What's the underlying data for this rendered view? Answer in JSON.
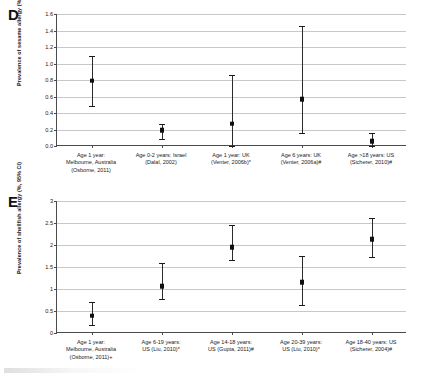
{
  "figure": {
    "panels": [
      {
        "letter": "D",
        "ylabel": "Prevalence of sesame allergy (%, 95% CI)"
      },
      {
        "letter": "E",
        "ylabel": "Prevalence of shellfish allergy (%, 95% CI)"
      }
    ]
  },
  "chart_data": [
    {
      "type": "scatter",
      "panel": "D",
      "title": "",
      "xlabel": "",
      "ylabel": "Prevalence of sesame allergy (%, 95% CI)",
      "ylim": [
        0.0,
        1.6
      ],
      "yticks": [
        "0.0",
        "0.2",
        "0.4",
        "0.6",
        "0.8",
        "1.0",
        "1.2",
        "1.4",
        "1.6"
      ],
      "ytick_values": [
        0.0,
        0.2,
        0.4,
        0.6,
        0.8,
        1.0,
        1.2,
        1.4,
        1.6
      ],
      "grid": true,
      "legend": "none",
      "categories": [
        "Age 1 year: Melbourne, Australia (Osborne, 2011)",
        "Age 0-2 years: Israel (Dalal, 2002)",
        "Age 1 year: UK (Venter, 2006b)*",
        "Age 6 years: UK (Venter, 2006a)#",
        "Age >18 years: US (Sicherer, 2010)#"
      ],
      "category_lines": [
        [
          "Age 1 year:",
          "Melbourne, Australia",
          "(Osborne, 2011)"
        ],
        [
          "Age 0-2 years: Israel",
          "(Dalal, 2002)"
        ],
        [
          "Age 1 year: UK",
          "(Venter, 2006b)*"
        ],
        [
          "Age 6 years: UK",
          "(Venter, 2006a)#"
        ],
        [
          "Age >18 years: US",
          "(Sicherer, 2010)#"
        ]
      ],
      "values": [
        0.79,
        0.19,
        0.27,
        0.57,
        0.06
      ],
      "ci_low": [
        0.49,
        0.08,
        0.0,
        0.16,
        -0.03
      ],
      "ci_high": [
        1.09,
        0.27,
        0.86,
        1.46,
        0.16
      ]
    },
    {
      "type": "scatter",
      "panel": "E",
      "title": "",
      "xlabel": "",
      "ylabel": "Prevalence of shellfish allergy (%, 95% CI)",
      "ylim": [
        0,
        3
      ],
      "yticks": [
        "0",
        "0.5",
        "1",
        "1.5",
        "2",
        "2.5",
        "3"
      ],
      "ytick_values": [
        0,
        0.5,
        1,
        1.5,
        2,
        2.5,
        3
      ],
      "grid": true,
      "legend": "none",
      "categories": [
        "Age 1 year: Melbourne, Australia (Osborne, 2011)+",
        "Age 6-19 years: US (Liu, 2010)*",
        "Age 14-18 years: US (Gupta, 2011)#",
        "Age 20-39 years: US (Liu, 2010)*",
        "Age 18-40 years: US (Sicherer, 2004)#"
      ],
      "category_lines": [
        [
          "Age 1 year:",
          "Melbourne, Australia",
          "(Osborne, 2011)+"
        ],
        [
          "Age 6-19 years:",
          "US (Liu, 2010)*"
        ],
        [
          "Age 14-18 years:",
          "US (Gupta, 2011)#"
        ],
        [
          "Age 20-39 years:",
          "US (Liu, 2010)*"
        ],
        [
          "Age 18-40 years: US",
          "(Sicherer, 2004)#"
        ]
      ],
      "values": [
        0.39,
        1.07,
        1.95,
        1.15,
        2.13
      ],
      "ci_low": [
        0.19,
        0.77,
        1.65,
        0.64,
        1.73
      ],
      "ci_high": [
        0.7,
        1.58,
        2.45,
        1.74,
        2.62
      ]
    }
  ],
  "colors": {
    "marker": "#111111",
    "gridline": "#c8c8c8",
    "axis": "#4a4a4a",
    "text": "#1a1a1a",
    "background": "#ffffff"
  }
}
